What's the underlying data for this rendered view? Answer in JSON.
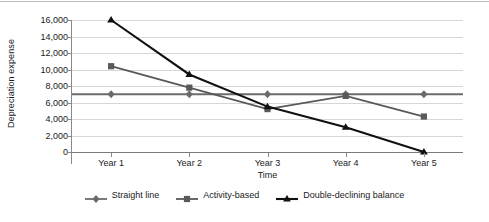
{
  "chart_data": {
    "type": "line",
    "title": "",
    "xlabel": "Time",
    "ylabel": "Depreciation expense",
    "categories": [
      "Year 1",
      "Year 2",
      "Year 3",
      "Year 4",
      "Year 5"
    ],
    "ylim": [
      0,
      16000
    ],
    "ytick_labels": [
      "0",
      "2,000",
      "4,000",
      "6,000",
      "8,000",
      "10,000",
      "12,000",
      "14,000",
      "16,000"
    ],
    "ytick_values": [
      0,
      2000,
      4000,
      6000,
      8000,
      10000,
      12000,
      14000,
      16000
    ],
    "grid": true,
    "legend_position": "bottom",
    "series": [
      {
        "name": "Straight line",
        "marker": "diamond",
        "color": "#6b6b6b",
        "values": [
          7000,
          7000,
          7000,
          7000,
          7000
        ]
      },
      {
        "name": "Activity-based",
        "marker": "square",
        "color": "#595959",
        "values": [
          10400,
          7800,
          5200,
          6800,
          4300
        ]
      },
      {
        "name": "Double-declining balance",
        "marker": "triangle",
        "color": "#111111",
        "values": [
          16000,
          9400,
          5500,
          3000,
          0
        ]
      }
    ]
  },
  "legend": {
    "items": [
      {
        "label": "Straight line"
      },
      {
        "label": "Activity-based"
      },
      {
        "label": "Double-declining balance"
      }
    ]
  }
}
